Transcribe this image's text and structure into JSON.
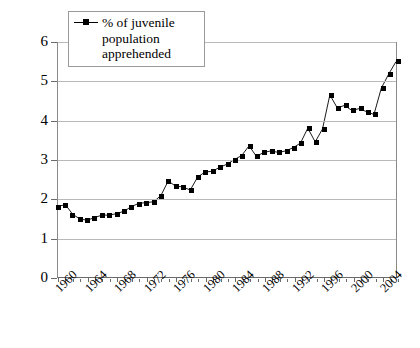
{
  "chart_data": {
    "type": "line",
    "title": "",
    "xlabel": "",
    "ylabel": "",
    "legend": [
      "% of juvenile population apprehended"
    ],
    "legend_position": "top-left-inside",
    "grid": true,
    "marker": "square",
    "ylim": [
      0,
      6
    ],
    "yticks": [
      0,
      1,
      2,
      3,
      4,
      5,
      6
    ],
    "ytick_labels": [
      "0",
      "1",
      "2",
      "3",
      "4",
      "5",
      "6"
    ],
    "xlim": [
      1960,
      2006
    ],
    "xticks": [
      1960,
      1964,
      1968,
      1972,
      1976,
      1980,
      1984,
      1988,
      1992,
      1996,
      2000,
      2004
    ],
    "xtick_labels": [
      "1960",
      "1964",
      "1968",
      "1972",
      "1976",
      "1980",
      "1984",
      "1988",
      "1992",
      "1996",
      "2000",
      "2004"
    ],
    "xtick_rotation": -45,
    "minor_xticks_every": 1,
    "x": [
      1960,
      1961,
      1962,
      1963,
      1964,
      1965,
      1966,
      1967,
      1968,
      1969,
      1970,
      1971,
      1972,
      1973,
      1974,
      1975,
      1976,
      1977,
      1978,
      1979,
      1980,
      1981,
      1982,
      1983,
      1984,
      1985,
      1986,
      1987,
      1988,
      1989,
      1990,
      1991,
      1992,
      1993,
      1994,
      1995,
      1996,
      1997,
      1998,
      1999,
      2000,
      2001,
      2002,
      2003,
      2004,
      2005,
      2006
    ],
    "series": [
      {
        "name": "% of juvenile population apprehended",
        "color": "#000000",
        "values": [
          1.8,
          1.85,
          1.6,
          1.48,
          1.45,
          1.52,
          1.58,
          1.58,
          1.62,
          1.68,
          1.8,
          1.88,
          1.9,
          1.92,
          2.08,
          2.45,
          2.32,
          2.3,
          2.22,
          2.55,
          2.68,
          2.7,
          2.8,
          2.88,
          3.0,
          3.1,
          3.35,
          3.08,
          3.18,
          3.22,
          3.18,
          3.22,
          3.3,
          3.42,
          3.8,
          3.45,
          3.78,
          4.65,
          4.32,
          4.38,
          4.25,
          4.3,
          4.22,
          4.15,
          4.82,
          5.18,
          5.5
        ]
      }
    ]
  }
}
